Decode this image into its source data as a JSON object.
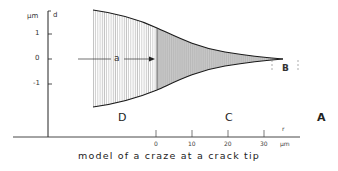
{
  "figure": {
    "caption": "model of a craze at a crack tip",
    "y_axis": {
      "unit": "µm",
      "variable": "d",
      "ticks": [
        {
          "label": "1",
          "value": 1
        },
        {
          "label": "0",
          "value": 0
        },
        {
          "label": "-1",
          "value": -1
        }
      ]
    },
    "x_axis": {
      "variable": "r",
      "unit": "µm",
      "ticks": [
        {
          "label": "0",
          "value": 0
        },
        {
          "label": "10",
          "value": 10
        },
        {
          "label": "20",
          "value": 20
        },
        {
          "label": "30",
          "value": 30
        }
      ]
    },
    "annotations": {
      "crack_length": "a",
      "tip_region": "B",
      "craze_region": "C",
      "crack_region": "D",
      "panel_label": "A"
    }
  }
}
